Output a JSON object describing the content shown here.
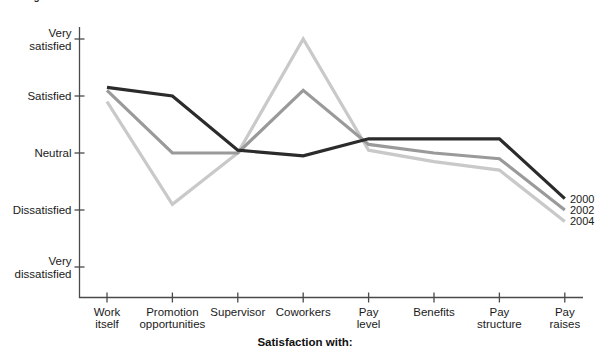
{
  "chart_title": "Average level of satisfaction with facets of work",
  "x_axis_title": "Satisfaction with:",
  "colors": {
    "axis": "#4a4a4a",
    "series_2000": "#2b2b2b",
    "series_2002": "#9a9a9a",
    "series_2004": "#c9c9c9",
    "text": "#1a1a1a"
  },
  "y_axis": {
    "labels": [
      "Very\nsatisfied",
      "Satisfied",
      "Neutral",
      "Dissatisfied",
      "Very\ndissatisfied"
    ],
    "values": [
      5,
      4,
      3,
      2,
      1
    ]
  },
  "x_axis": {
    "labels": [
      "Work\nitself",
      "Promotion\nopportunities",
      "Supervisor",
      "Coworkers",
      "Pay\nlevel",
      "Benefits",
      "Pay\nstructure",
      "Pay\nraises"
    ]
  },
  "legend": {
    "items": [
      {
        "label": "2000"
      },
      {
        "label": "2002"
      },
      {
        "label": "2004"
      }
    ]
  },
  "chart_data": {
    "type": "line",
    "title": "Average level of satisfaction with facets of work",
    "xlabel": "Satisfaction with:",
    "ylabel": "",
    "grid": false,
    "legend_position": "right",
    "ylim": [
      1,
      5
    ],
    "ytick_labels": [
      "Very dissatisfied",
      "Dissatisfied",
      "Neutral",
      "Satisfied",
      "Very satisfied"
    ],
    "ytick_values": [
      1,
      2,
      3,
      4,
      5
    ],
    "categories": [
      "Work itself",
      "Promotion opportunities",
      "Supervisor",
      "Coworkers",
      "Pay level",
      "Benefits",
      "Pay structure",
      "Pay raises"
    ],
    "series": [
      {
        "name": "2000",
        "color": "#2b2b2b",
        "values": [
          4.15,
          4.0,
          3.05,
          2.95,
          3.25,
          3.25,
          3.25,
          2.2
        ]
      },
      {
        "name": "2002",
        "color": "#9a9a9a",
        "values": [
          4.1,
          3.0,
          3.0,
          4.1,
          3.15,
          3.0,
          2.9,
          2.0
        ]
      },
      {
        "name": "2004",
        "color": "#c9c9c9",
        "values": [
          3.9,
          2.1,
          3.0,
          5.0,
          3.05,
          2.85,
          2.7,
          1.8
        ]
      }
    ]
  }
}
